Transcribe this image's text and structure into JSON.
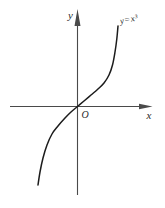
{
  "figure": {
    "background": "#ffffff",
    "ink_color": "#1c1c1c",
    "axis_color": "#4a4a4a",
    "text_color": "#2b2b2b",
    "axis_labels": {
      "x": "x",
      "y": "y",
      "origin": "O"
    },
    "curve_label": "y=x³"
  },
  "chart_data": {
    "type": "line",
    "title": "",
    "xlabel": "x",
    "ylabel": "y",
    "grid": false,
    "legend": "none",
    "tick_labels": "none (unlabeled axes, origin marked O)",
    "xlim": [
      -2,
      2.1
    ],
    "ylim": [
      -4.8,
      5.2
    ],
    "annotations": [
      {
        "text": "y=x³",
        "position": "upper-right, at top end of curve"
      }
    ],
    "series": [
      {
        "name": "y=x³",
        "function": "y = x^3",
        "x": [
          -1.6,
          -1.4,
          -1.2,
          -1.0,
          -0.8,
          -0.6,
          -0.4,
          -0.2,
          0,
          0.2,
          0.4,
          0.6,
          0.8,
          1.0,
          1.2,
          1.4,
          1.6
        ],
        "y": [
          -4.096,
          -2.744,
          -1.728,
          -1.0,
          -0.512,
          -0.216,
          -0.064,
          -0.008,
          0,
          0.008,
          0.064,
          0.216,
          0.512,
          1.0,
          1.728,
          2.744,
          4.096
        ]
      }
    ],
    "layout_px": {
      "origin": [
        77.5,
        106.5
      ],
      "x_axis": {
        "from": [
          10,
          106.5
        ],
        "to": [
          140.5,
          106.5
        ]
      },
      "y_axis": {
        "from": [
          77.5,
          195
        ],
        "to": [
          77.5,
          23.5
        ]
      },
      "x_arrow": [
        [
          152.5,
          106.5
        ],
        [
          139,
          103.7
        ],
        [
          139,
          109.3
        ]
      ],
      "y_arrow": [
        [
          77.5,
          9
        ],
        [
          74.5,
          26
        ],
        [
          80.5,
          26
        ]
      ],
      "curve_points": [
        [
          38,
          185
        ],
        [
          40,
          172
        ],
        [
          43,
          158
        ],
        [
          47,
          145
        ],
        [
          52,
          134
        ],
        [
          58,
          126
        ],
        [
          65,
          118
        ],
        [
          71,
          112
        ],
        [
          77.5,
          106.5
        ],
        [
          84,
          101
        ],
        [
          91,
          95
        ],
        [
          98,
          89
        ],
        [
          104,
          83
        ],
        [
          109,
          75
        ],
        [
          112.5,
          65
        ],
        [
          115,
          52
        ],
        [
          116.8,
          39
        ],
        [
          118,
          26
        ]
      ],
      "curve_label_pos": [
        120.5,
        24
      ],
      "curve_label_rotation": -12,
      "x_label_pos": [
        146.5,
        118.5
      ],
      "y_label_pos": [
        73,
        19
      ],
      "origin_label_pos": [
        81.5,
        117.5
      ]
    }
  }
}
